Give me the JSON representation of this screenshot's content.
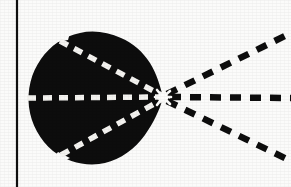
{
  "figure": {
    "canvas": {
      "width": 291,
      "height": 187
    },
    "background_color": "#fbfbfa",
    "ink_color": "#0d0d0d",
    "paper_color": "#fcfcfb"
  },
  "border": {
    "name": "left-rule",
    "orientation": "vertical",
    "x": 17,
    "y_start": 0,
    "y_end": 187,
    "thickness": 2.2,
    "color": "#101010"
  },
  "lobe": {
    "name": "black-lobe",
    "fill_color": "#0d0d0d",
    "vertex": {
      "x": 163,
      "y": 97
    },
    "bounds": {
      "left": 28,
      "top": 33,
      "right": 163,
      "bottom": 163
    },
    "outline_path": "M 163 97 C 159 80 152 64 142 52 C 131 39 113 32 94 32 C 72 32 52 42 40 58 C 29 73 26 92 30 110 C 35 130 49 148 68 157 C 86 165 108 165 125 155 C 141 146 153 130 159 113 C 161 108 162 102 163 97 Z",
    "notches": [
      {
        "name": "top-notch",
        "x": 60,
        "y": 38
      },
      {
        "name": "bottom-notch",
        "x": 62,
        "y": 156
      }
    ]
  },
  "rays": {
    "inner_color": "#f4f3f0",
    "outer_color": "#0d0d0d",
    "dash_pattern_inner": "9 7",
    "dash_pattern_outer": "11 9",
    "stroke_width_inner": 5.5,
    "stroke_width_outer": 6.5,
    "items": [
      {
        "name": "ray-inner-upper",
        "kind": "inner",
        "label": "upper inner dashed ray",
        "x1": 60,
        "y1": 41,
        "x2": 163,
        "y2": 96
      },
      {
        "name": "ray-inner-axis",
        "kind": "inner",
        "label": "axial inner dashed ray",
        "x1": 27,
        "y1": 98,
        "x2": 163,
        "y2": 97
      },
      {
        "name": "ray-inner-lower",
        "kind": "inner",
        "label": "lower inner dashed ray",
        "x1": 61,
        "y1": 155,
        "x2": 163,
        "y2": 99
      },
      {
        "name": "ray-outer-upper",
        "kind": "outer",
        "label": "upper outer dashed ray",
        "x1": 167,
        "y1": 94,
        "x2": 291,
        "y2": 33
      },
      {
        "name": "ray-outer-axis",
        "kind": "outer",
        "label": "axial outer dashed ray",
        "x1": 170,
        "y1": 97,
        "x2": 291,
        "y2": 98
      },
      {
        "name": "ray-outer-lower",
        "kind": "outer",
        "label": "lower outer dashed ray",
        "x1": 167,
        "y1": 101,
        "x2": 291,
        "y2": 161
      }
    ]
  },
  "vertex_marker": {
    "name": "convergence-vertex",
    "x": 163,
    "y": 97,
    "radius": 5,
    "color": "#fcfcfb",
    "spoke_count": 6
  }
}
